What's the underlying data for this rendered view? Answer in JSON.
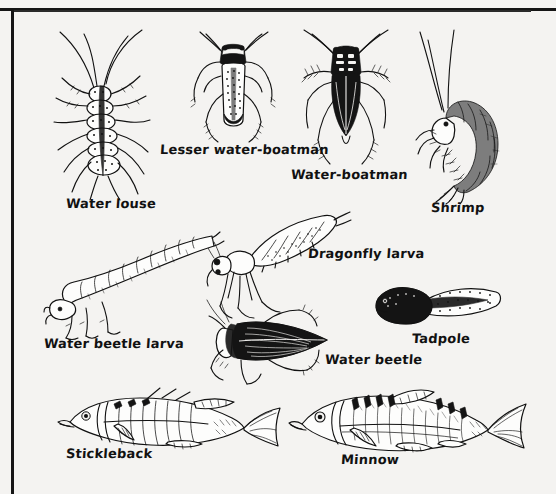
{
  "page": {
    "kind": "scanned-book-illustration-plate",
    "background_color": "#f4f3f1",
    "ink_color": "#111111",
    "frame": {
      "top_rule": true,
      "left_rule": true,
      "right_rule": false,
      "bottom_rule": false
    }
  },
  "figures": [
    {
      "id": "water-louse",
      "label": "Water louse",
      "icon": "water-louse-icon",
      "label_x": 66,
      "label_y": 202,
      "fig_x": 48,
      "fig_y": 28,
      "fig_w": 120,
      "fig_h": 168
    },
    {
      "id": "lesser-water-boatman",
      "label": "Lesser water-boatman",
      "icon": "lesser-water-boatman-icon",
      "label_x": 160,
      "label_y": 148,
      "fig_x": 180,
      "fig_y": 30,
      "fig_w": 110,
      "fig_h": 115
    },
    {
      "id": "water-boatman",
      "label": "Water-boatman",
      "icon": "water-boatman-icon",
      "label_x": 291,
      "label_y": 173,
      "fig_x": 288,
      "fig_y": 30,
      "fig_w": 120,
      "fig_h": 135
    },
    {
      "id": "shrimp",
      "label": "Shrimp",
      "icon": "shrimp-icon",
      "label_x": 431,
      "label_y": 206,
      "fig_x": 408,
      "fig_y": 28,
      "fig_w": 120,
      "fig_h": 172
    },
    {
      "id": "dragonfly-larva",
      "label": "Dragonfly larva",
      "icon": "dragonfly-larva-icon",
      "label_x": 308,
      "label_y": 252,
      "fig_x": 208,
      "fig_y": 212,
      "fig_w": 140,
      "fig_h": 110
    },
    {
      "id": "water-beetle-larva",
      "label": "Water beetle larva",
      "icon": "water-beetle-larva-icon",
      "label_x": 44,
      "label_y": 342,
      "fig_x": 48,
      "fig_y": 238,
      "fig_w": 165,
      "fig_h": 100
    },
    {
      "id": "water-beetle",
      "label": "Water beetle",
      "icon": "water-beetle-icon",
      "label_x": 325,
      "label_y": 358,
      "fig_x": 205,
      "fig_y": 300,
      "fig_w": 140,
      "fig_h": 82
    },
    {
      "id": "tadpole",
      "label": "Tadpole",
      "icon": "tadpole-icon",
      "label_x": 412,
      "label_y": 337,
      "fig_x": 372,
      "fig_y": 286,
      "fig_w": 130,
      "fig_h": 50
    },
    {
      "id": "stickleback",
      "label": "Stickleback",
      "icon": "stickleback-icon",
      "label_x": 66,
      "label_y": 452,
      "fig_x": 58,
      "fig_y": 392,
      "fig_w": 220,
      "fig_h": 68
    },
    {
      "id": "minnow",
      "label": "Minnow",
      "icon": "minnow-icon",
      "label_x": 341,
      "label_y": 458,
      "fig_x": 290,
      "fig_y": 390,
      "fig_w": 230,
      "fig_h": 72
    }
  ]
}
